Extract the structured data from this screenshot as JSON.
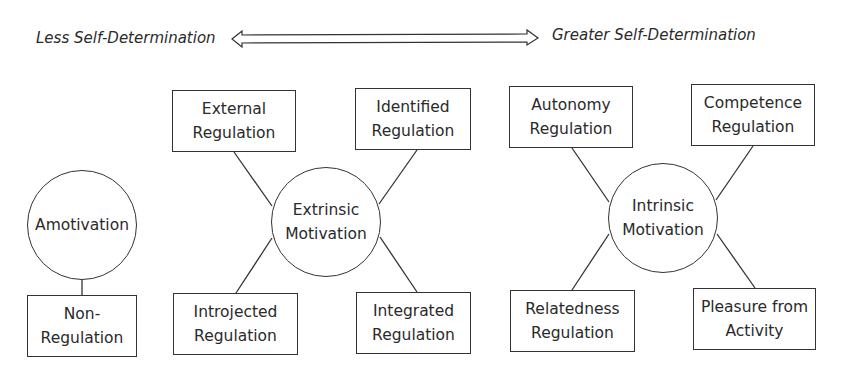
{
  "scale": {
    "left_label": "Less Self-Determination",
    "right_label": "Greater Self-Determination",
    "arrow": "double-headed-arrow"
  },
  "amotivation": {
    "center": {
      "line1": "Amotivation"
    },
    "regulation": {
      "line1": "Non-",
      "line2": "Regulation"
    }
  },
  "extrinsic": {
    "center": {
      "line1": "Extrinsic",
      "line2": "Motivation"
    },
    "top_left": {
      "line1": "External",
      "line2": "Regulation"
    },
    "top_right": {
      "line1": "Identified",
      "line2": "Regulation"
    },
    "bottom_left": {
      "line1": "Introjected",
      "line2": "Regulation"
    },
    "bottom_right": {
      "line1": "Integrated",
      "line2": "Regulation"
    }
  },
  "intrinsic": {
    "center": {
      "line1": "Intrinsic",
      "line2": "Motivation"
    },
    "top_left": {
      "line1": "Autonomy",
      "line2": "Regulation"
    },
    "top_right": {
      "line1": "Competence",
      "line2": "Regulation"
    },
    "bottom_left": {
      "line1": "Relatedness",
      "line2": "Regulation"
    },
    "bottom_right": {
      "line1": "Pleasure from",
      "line2": "Activity"
    }
  }
}
